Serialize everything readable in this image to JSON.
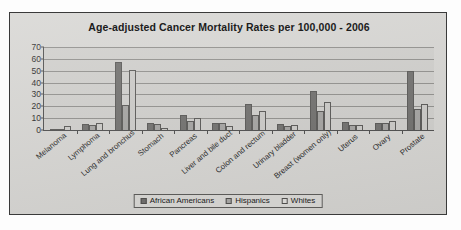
{
  "chart_data": {
    "type": "bar",
    "title": "Age-adjusted Cancer Mortality Rates per 100,000 - 2006",
    "xlabel": "",
    "ylabel": "",
    "ylim": [
      0,
      70
    ],
    "yticks": [
      0,
      10,
      20,
      30,
      40,
      50,
      60,
      70
    ],
    "grid": true,
    "legend_position": "bottom",
    "categories": [
      "Melanoma",
      "Lymphoma",
      "Lung and bronchus",
      "Stomach",
      "Pancreas",
      "Liver and bile duct",
      "Colon and rectum",
      "Urinary bladder",
      "Breast (women only)",
      "Uterus",
      "Ovary",
      "Prostate"
    ],
    "series": [
      {
        "name": "African Americans",
        "color": "#6e6d6b",
        "values": [
          1,
          5,
          57,
          6,
          13,
          6,
          22,
          5,
          33,
          7,
          6,
          50
        ]
      },
      {
        "name": "Hispanics",
        "color": "#a3a2a0",
        "values": [
          0,
          4,
          21,
          5,
          8,
          6,
          13,
          3,
          16,
          4,
          6,
          18
        ]
      },
      {
        "name": "Whites",
        "color": "#d8d7d4",
        "values": [
          3,
          6,
          51,
          2,
          10,
          3,
          16,
          4,
          24,
          4,
          8,
          22
        ]
      }
    ]
  }
}
